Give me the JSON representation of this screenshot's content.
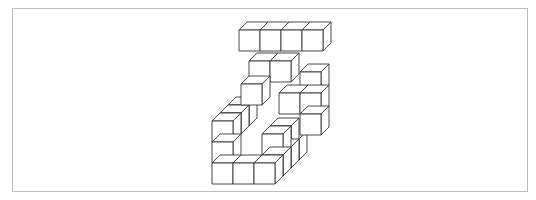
{
  "figure": {
    "stroke_color": "#333333",
    "fill_color": "#ffffff",
    "frame_color": "#bdbdbd",
    "unit": 21,
    "depth_dx": 8,
    "depth_dy": -8,
    "cubes": [
      {
        "x": 212,
        "y": 163,
        "d": 0
      },
      {
        "x": 233,
        "y": 163,
        "d": 0
      },
      {
        "x": 254,
        "y": 163,
        "d": 0
      },
      {
        "x": 262,
        "y": 155,
        "d": 1
      },
      {
        "x": 270,
        "y": 147,
        "d": 2
      },
      {
        "x": 278,
        "y": 139,
        "d": 3
      },
      {
        "x": 212,
        "y": 142,
        "d": 0
      },
      {
        "x": 212,
        "y": 121,
        "d": 0
      },
      {
        "x": 262,
        "y": 134,
        "d": 1
      },
      {
        "x": 270,
        "y": 126,
        "d": 2
      },
      {
        "x": 220,
        "y": 113,
        "d": 1
      },
      {
        "x": 228,
        "y": 105,
        "d": 2
      },
      {
        "x": 300,
        "y": 114,
        "d": 0
      },
      {
        "x": 300,
        "y": 93,
        "d": 0
      },
      {
        "x": 300,
        "y": 72,
        "d": 0
      },
      {
        "x": 279,
        "y": 93,
        "d": 0
      },
      {
        "x": 241,
        "y": 84,
        "d": 0
      },
      {
        "x": 249,
        "y": 61,
        "d": 0
      },
      {
        "x": 270,
        "y": 61,
        "d": 0
      },
      {
        "x": 239,
        "y": 30,
        "d": 0
      },
      {
        "x": 260,
        "y": 30,
        "d": 0
      },
      {
        "x": 281,
        "y": 30,
        "d": 0
      },
      {
        "x": 302,
        "y": 30,
        "d": 0
      }
    ]
  }
}
